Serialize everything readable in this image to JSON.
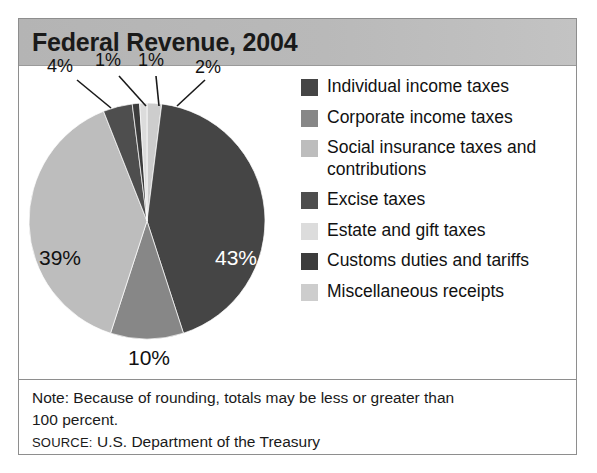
{
  "figure": {
    "title": "Federal Revenue, 2004",
    "frame_color": "#8e8e8e",
    "header_band_color": "#b7b7b7",
    "background_color": "#ffffff"
  },
  "chart_data": {
    "type": "pie",
    "title": "Federal Revenue, 2004",
    "unit": "percent",
    "start_angle_deg": 0,
    "direction": "clockwise",
    "categories": [
      "Individual income taxes",
      "Corporate income taxes",
      "Social insurance taxes and contributions",
      "Excise taxes",
      "Estate and gift taxes",
      "Customs duties and tariffs",
      "Miscellaneous receipts"
    ],
    "values": [
      43,
      10,
      39,
      4,
      1,
      1,
      2
    ],
    "value_labels": [
      "43%",
      "10%",
      "39%",
      "4%",
      "1%",
      "1%",
      "2%"
    ],
    "colors": [
      "#454545",
      "#878787",
      "#bdbdbd",
      "#4e4e4e",
      "#dcdcdc",
      "#3c3c3c",
      "#cdcdcd"
    ],
    "slice_order_clockwise_from_top": [
      {
        "name": "Miscellaneous receipts",
        "value": 2
      },
      {
        "name": "Individual income taxes",
        "value": 43
      },
      {
        "name": "Corporate income taxes",
        "value": 10
      },
      {
        "name": "Social insurance taxes and contributions",
        "value": 39
      },
      {
        "name": "Excise taxes",
        "value": 4
      },
      {
        "name": "Customs duties and tariffs",
        "value": 1
      },
      {
        "name": "Estate and gift taxes",
        "value": 1
      }
    ],
    "inside_labels": [
      {
        "text": "43%",
        "slice": "Individual income taxes",
        "on_dark": true
      },
      {
        "text": "39%",
        "slice": "Social insurance taxes and contributions",
        "on_dark": false
      },
      {
        "text": "10%",
        "slice": "Corporate income taxes",
        "on_dark": false
      }
    ],
    "callout_labels": [
      {
        "text": "4%",
        "slice": "Excise taxes"
      },
      {
        "text": "1%",
        "slice": "Customs duties and tariffs"
      },
      {
        "text": "1%",
        "slice": "Estate and gift taxes"
      },
      {
        "text": "2%",
        "slice": "Miscellaneous receipts"
      }
    ],
    "legend_position": "right",
    "grid": false
  },
  "legend": {
    "items": [
      {
        "label": "Individual income taxes",
        "color": "#454545"
      },
      {
        "label": "Corporate income taxes",
        "color": "#878787"
      },
      {
        "label": "Social insurance taxes and contributions",
        "color": "#bdbdbd"
      },
      {
        "label": "Excise taxes",
        "color": "#4e4e4e"
      },
      {
        "label": "Estate and gift taxes",
        "color": "#dcdcdc"
      },
      {
        "label": "Customs duties and tariffs",
        "color": "#3c3c3c"
      },
      {
        "label": "Miscellaneous receipts",
        "color": "#cdcdcd"
      }
    ]
  },
  "footnote": {
    "note_line_1": "Note: Because of rounding, totals may be less or greater than",
    "note_line_2": "100 percent.",
    "source_keyword": "SOURCE:",
    "source_text": " U.S. Department of the Treasury"
  }
}
